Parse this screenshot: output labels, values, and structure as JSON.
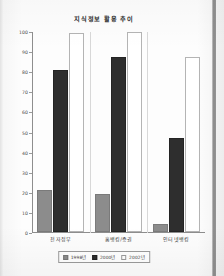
{
  "chart_data": {
    "type": "bar",
    "title": "지식정보 활용 추이",
    "xlabel": "",
    "ylabel": "",
    "ylim": [
      0,
      100
    ],
    "yticks": [
      0,
      10,
      20,
      30,
      40,
      50,
      60,
      70,
      80,
      90,
      100
    ],
    "ytick_labels": [
      "0",
      "10",
      "20",
      "30",
      "40",
      "50",
      "60",
      "70",
      "80",
      "90",
      "100"
    ],
    "grid": false,
    "legend_position": "bottom-center",
    "categories": [
      "전자정부",
      "홈뱅킹/증권",
      "인터넷뱅킹"
    ],
    "series": [
      {
        "name": "1998년",
        "color": "#8c8c8c",
        "values": [
          21,
          19,
          4
        ]
      },
      {
        "name": "2000년",
        "color": "#2e2e2e",
        "values": [
          80.5,
          87,
          47
        ]
      },
      {
        "name": "2002년",
        "color": "#ffffff",
        "values": [
          99,
          99.5,
          87
        ]
      }
    ]
  },
  "legend": {
    "items": [
      {
        "label": "1998년"
      },
      {
        "label": "2000년"
      },
      {
        "label": "2002년"
      }
    ]
  },
  "colors": {
    "series_1998": "#8c8c8c",
    "series_2000": "#2e2e2e",
    "series_2002": "#ffffff",
    "axis": "#8e8e8e",
    "text": "#3a3a3a",
    "page_background": "#fdfdfd"
  }
}
